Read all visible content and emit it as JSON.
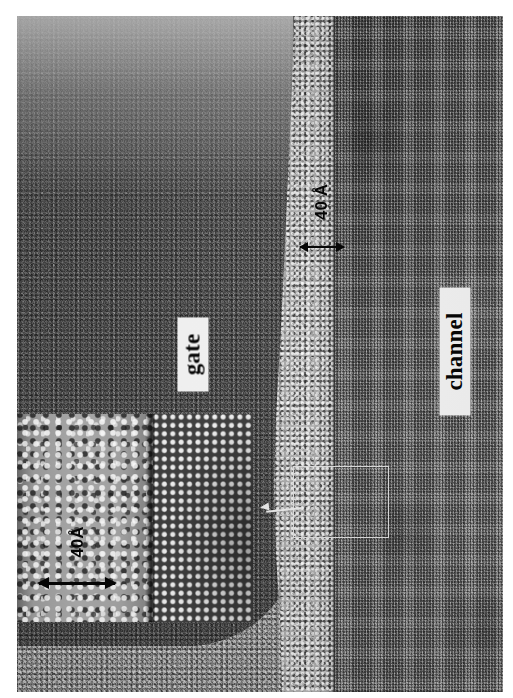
{
  "figure": {
    "kind": "tem-cross-section-micrograph",
    "background_color": "#ffffff"
  },
  "labels": {
    "gate": "gate",
    "channel": "channel"
  },
  "annotations": {
    "main_thickness": "40 Å",
    "inset_thickness": "40Å"
  },
  "regions": [
    {
      "name": "gate",
      "label": "gate",
      "appearance": "dark fine-grained polysilicon"
    },
    {
      "name": "gate-oxide",
      "label": "40 Å",
      "appearance": "bright speckled amorphous band"
    },
    {
      "name": "channel",
      "label": "channel",
      "appearance": "crystalline silicon lattice fringes"
    }
  ],
  "inset": {
    "left_panel": "amorphous oxide",
    "right_panel": "crystalline lattice",
    "scale_label": "40Å"
  },
  "roi": {
    "name": "region-of-interest",
    "shape": "rectangle",
    "stroke_color": "#dcdcdc"
  },
  "colors": {
    "paper": "#ffffff",
    "gate": "#454545",
    "oxide": "#b2b2b2",
    "channel": "#5f5f5f",
    "label_background": "#f2f2f2",
    "label_text": "#000000",
    "annotation": "#000000"
  }
}
